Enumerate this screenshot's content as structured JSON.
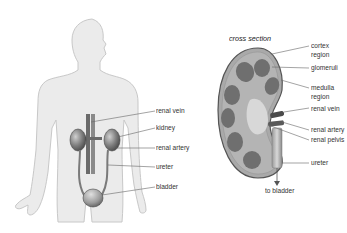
{
  "figure": {
    "left_panel": {
      "name": "urinary system in body",
      "labels": [
        {
          "id": "renal_vein",
          "text": "renal vein"
        },
        {
          "id": "kidney",
          "text": "kidney"
        },
        {
          "id": "renal_artery",
          "text": "renal artery"
        },
        {
          "id": "ureter",
          "text": "ureter"
        },
        {
          "id": "bladder",
          "text": "bladder"
        }
      ]
    },
    "right_panel": {
      "title": "cross section",
      "labels": [
        {
          "id": "cortex_region",
          "text": "cortex\nregion",
          "line1": "cortex",
          "line2": "region"
        },
        {
          "id": "glomeruli",
          "text": "glomeruli"
        },
        {
          "id": "medulla_region",
          "text": "medulla\nregion",
          "line1": "medulla",
          "line2": "region"
        },
        {
          "id": "renal_vein",
          "text": "renal vein"
        },
        {
          "id": "renal_artery",
          "text": "renal artery"
        },
        {
          "id": "renal_pelvis",
          "text": "renal pelvis"
        },
        {
          "id": "ureter",
          "text": "ureter"
        },
        {
          "id": "to_bladder",
          "text": "to bladder"
        }
      ]
    },
    "colors": {
      "silhouette_fill": "#ebebeb",
      "silhouette_stroke": "#c8c8c8",
      "organ_dark": "#555555",
      "organ_mid": "#8a8a8a",
      "kidney_cortex": "#a9a9a9",
      "kidney_medulla_pyramid": "#6f6f6f",
      "kidney_pelvis": "#d4d4d4",
      "leader_line": "#666666",
      "label_text": "#333333"
    }
  }
}
